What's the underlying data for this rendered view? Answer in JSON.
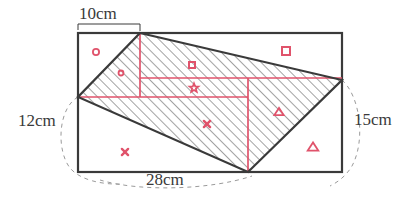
{
  "figure": {
    "dimensions": {
      "top": "10cm",
      "left": "12cm",
      "right": "15cm",
      "bottom": "28cm"
    },
    "colors": {
      "outline": "#3a3a3a",
      "annotation": "#e0536b",
      "hatch": "#555555",
      "dashed": "#9a9a9a",
      "background": "#ffffff"
    },
    "rectangle": {
      "x": 78,
      "y": 33,
      "width": 264,
      "height": 139
    },
    "quadrilateral": {
      "points": [
        {
          "name": "top-vertex",
          "x": 140,
          "y": 33
        },
        {
          "name": "right-vertex",
          "x": 342,
          "y": 80
        },
        {
          "name": "bottom-vertex",
          "x": 248,
          "y": 172
        },
        {
          "name": "left-vertex",
          "x": 78,
          "y": 97
        }
      ],
      "shaded": true
    },
    "grid_lines": [
      {
        "name": "horizontal-lower",
        "x1": 78,
        "y1": 97,
        "x2": 248,
        "y2": 97
      },
      {
        "name": "horizontal-upper",
        "x1": 140,
        "y1": 78,
        "x2": 342,
        "y2": 78
      },
      {
        "name": "vertical-left",
        "x1": 140,
        "y1": 33,
        "x2": 140,
        "y2": 97
      },
      {
        "name": "vertical-right",
        "x1": 248,
        "y1": 78,
        "x2": 248,
        "y2": 172
      }
    ],
    "markers": [
      {
        "name": "circle-large",
        "shape": "circle",
        "x": 96,
        "y": 52,
        "size": 5
      },
      {
        "name": "circle-small",
        "shape": "circle",
        "x": 121,
        "y": 73,
        "size": 4
      },
      {
        "name": "square-inner",
        "shape": "square",
        "x": 192,
        "y": 65,
        "size": 6
      },
      {
        "name": "square-outer",
        "shape": "square",
        "x": 286,
        "y": 51,
        "size": 8
      },
      {
        "name": "star-center",
        "shape": "star",
        "x": 194,
        "y": 88,
        "size": 6
      },
      {
        "name": "triangle-inner",
        "shape": "triangle",
        "x": 279,
        "y": 112,
        "size": 7
      },
      {
        "name": "triangle-outer",
        "shape": "triangle",
        "x": 313,
        "y": 147,
        "size": 8
      },
      {
        "name": "cross-center",
        "shape": "cross",
        "x": 207,
        "y": 124,
        "size": 5
      },
      {
        "name": "cross-lower",
        "shape": "cross",
        "x": 125,
        "y": 152,
        "size": 5
      }
    ],
    "dashed_arcs": [
      {
        "name": "arc-left",
        "d": "M 78 97 C 58 108, 56 150, 70 168 C 80 180, 102 185, 124 184"
      },
      {
        "name": "arc-bottom",
        "d": "M 100 180 C 140 192, 210 190, 252 176"
      },
      {
        "name": "arc-right",
        "d": "M 342 80 C 360 96, 366 140, 352 166 C 346 176, 338 182, 330 186"
      }
    ],
    "leader_top": {
      "name": "leader-top",
      "d": "M 78 30 L 78 24 L 140 24 L 140 31"
    }
  }
}
